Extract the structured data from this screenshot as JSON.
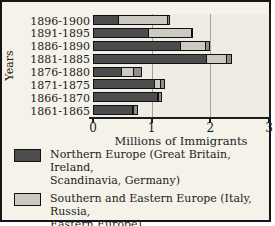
{
  "chart_data": {
    "type": "bar",
    "orientation": "horizontal-stacked",
    "xlabel": "Millions of Immigrants",
    "ylabel": "Years",
    "xlim": [
      0,
      3
    ],
    "xticks": [
      0,
      1,
      2,
      3
    ],
    "grid": "vertical gridlines at x=1 and x=2",
    "legend_position": "bottom",
    "categories": [
      "1896-1900",
      "1891-1895",
      "1886-1890",
      "1881-1885",
      "1876-1880",
      "1871-1875",
      "1866-1870",
      "1861-1865"
    ],
    "series": [
      {
        "name": "Northern Europe (Great Britain, Ireland, Scandinavia, Germany)",
        "color": "#4c4c4c",
        "values": [
          0.45,
          0.95,
          1.5,
          1.95,
          0.5,
          1.05,
          1.1,
          0.68
        ]
      },
      {
        "name": "Southern and Eastern Europe (Italy, Russia, Eastern Europe)",
        "color": "#cbc9c2",
        "values": [
          0.85,
          0.75,
          0.45,
          0.35,
          0.22,
          0.12,
          0.05,
          0.03
        ]
      },
      {
        "name": "China",
        "color": "#8e8d88",
        "values": [
          0.05,
          0.03,
          0.08,
          0.1,
          0.15,
          0.1,
          0.06,
          0.09
        ]
      }
    ]
  },
  "legend": {
    "items": [
      {
        "label": "Northern Europe (Great Britain, Ireland,\nScandinavia, Germany)",
        "color": "#4c4c4c"
      },
      {
        "label": "Southern and Eastern Europe (Italy, Russia,\nEastern Europe)",
        "color": "#cbc9c2"
      },
      {
        "label": "China",
        "color": "#8e8d88"
      }
    ]
  },
  "colors": {
    "card_background": "#f5f2ea",
    "plot_background": "#efece4",
    "border": "#151515",
    "gridline": "#a3a29a",
    "text": "#1c1c1c"
  }
}
